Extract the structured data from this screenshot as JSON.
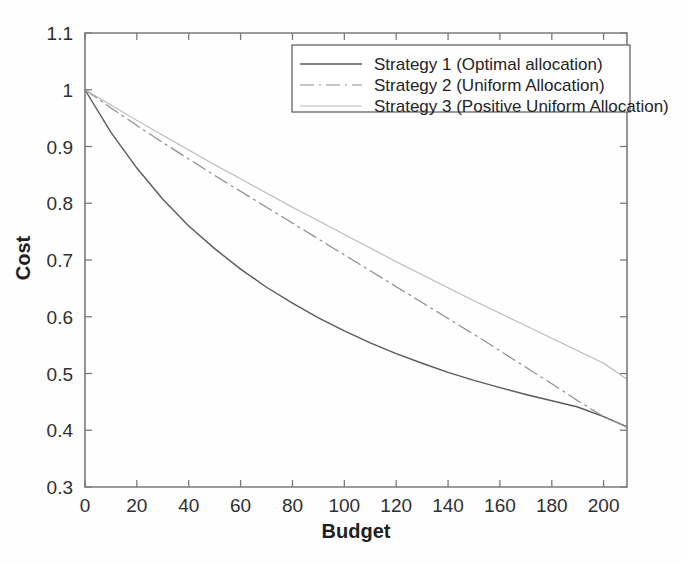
{
  "chart_data": {
    "type": "line",
    "title": "",
    "xlabel": "Budget",
    "ylabel": "Cost",
    "xlim": [
      0,
      209
    ],
    "ylim": [
      0.3,
      1.1
    ],
    "xticks": [
      0,
      20,
      40,
      60,
      80,
      100,
      120,
      140,
      160,
      180,
      200
    ],
    "yticks": [
      0.3,
      0.4,
      0.5,
      0.6,
      0.7,
      0.8,
      0.9,
      1,
      1.1
    ],
    "xtick_labels": [
      "0",
      "20",
      "40",
      "60",
      "80",
      "100",
      "120",
      "140",
      "160",
      "180",
      "200"
    ],
    "ytick_labels": [
      "0.3",
      "0.4",
      "0.5",
      "0.6",
      "0.7",
      "0.8",
      "0.9",
      "1",
      "1.1"
    ],
    "grid": false,
    "legend_position": "top-right",
    "x": [
      0,
      10,
      20,
      30,
      40,
      50,
      60,
      70,
      80,
      90,
      100,
      110,
      120,
      130,
      140,
      150,
      160,
      170,
      180,
      190,
      200,
      209
    ],
    "series": [
      {
        "name": "Strategy 1 (Optimal allocation)",
        "label": "Strategy 1 (Optimal allocation)",
        "style": "solid",
        "color": "#5a5a5a",
        "values": [
          1.0,
          0.925,
          0.862,
          0.807,
          0.76,
          0.72,
          0.684,
          0.652,
          0.624,
          0.598,
          0.575,
          0.554,
          0.535,
          0.518,
          0.502,
          0.488,
          0.475,
          0.463,
          0.452,
          0.441,
          0.424,
          0.406
        ]
      },
      {
        "name": "Strategy 2 (Uniform Allocation)",
        "label": "Strategy 2 (Uniform Allocation)",
        "style": "dashdot",
        "color": "#8d8d8d",
        "values": [
          1.0,
          0.968,
          0.937,
          0.907,
          0.878,
          0.849,
          0.821,
          0.793,
          0.765,
          0.737,
          0.709,
          0.681,
          0.653,
          0.625,
          0.597,
          0.569,
          0.54,
          0.511,
          0.482,
          0.452,
          0.424,
          0.406
        ]
      },
      {
        "name": "Strategy 3 (Positive Uniform Allocation)",
        "label": "Strategy 3 (Positive Uniform Allocation)",
        "style": "faint-solid",
        "color": "#b9b9b9",
        "values": [
          1.0,
          0.973,
          0.946,
          0.92,
          0.894,
          0.868,
          0.843,
          0.818,
          0.793,
          0.769,
          0.745,
          0.721,
          0.697,
          0.674,
          0.651,
          0.628,
          0.606,
          0.584,
          0.562,
          0.54,
          0.518,
          0.49
        ]
      }
    ]
  },
  "legend": {
    "entries": [
      "Strategy 1 (Optimal allocation)",
      "Strategy 2 (Uniform Allocation)",
      "Strategy 3 (Positive Uniform Allocation)"
    ]
  }
}
